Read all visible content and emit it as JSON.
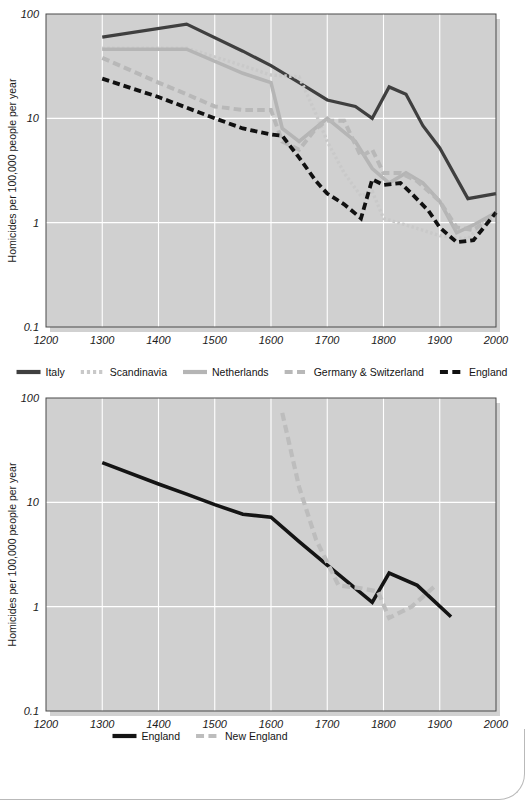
{
  "chart_data": [
    {
      "id": "chart-top",
      "type": "line",
      "title": "",
      "xlabel": "",
      "ylabel": "Homicides per 100,000 people per year",
      "xlim": [
        1200,
        2000
      ],
      "ylim": [
        0.1,
        100
      ],
      "yscale": "log",
      "xticks": [
        1200,
        1300,
        1400,
        1500,
        1600,
        1700,
        1800,
        1900,
        2000
      ],
      "yticks": [
        0.1,
        1,
        10,
        100
      ],
      "ytick_labels": [
        "0.1",
        "1",
        "10",
        "100"
      ],
      "grid": true,
      "legend_position": "below",
      "series": [
        {
          "name": "Italy",
          "color": "#3f3f3f",
          "style": "solid",
          "width": 3.2,
          "points": [
            [
              1300,
              60
            ],
            [
              1450,
              80
            ],
            [
              1550,
              44
            ],
            [
              1600,
              32
            ],
            [
              1650,
              22
            ],
            [
              1700,
              15
            ],
            [
              1750,
              13
            ],
            [
              1780,
              10
            ],
            [
              1810,
              20
            ],
            [
              1840,
              17
            ],
            [
              1870,
              8.5
            ],
            [
              1900,
              5.2
            ],
            [
              1950,
              1.7
            ],
            [
              2000,
              1.9
            ]
          ]
        },
        {
          "name": "Scandinavia",
          "color": "#c9c9c9",
          "style": "dotted",
          "width": 3.4,
          "points": [
            [
              1300,
              47
            ],
            [
              1450,
              47
            ],
            [
              1550,
              32
            ],
            [
              1600,
              26
            ],
            [
              1650,
              25
            ],
            [
              1680,
              11
            ],
            [
              1700,
              6.0
            ],
            [
              1730,
              3.0
            ],
            [
              1760,
              1.8
            ],
            [
              1780,
              2.0
            ],
            [
              1800,
              1.1
            ],
            [
              1840,
              0.95
            ],
            [
              1900,
              0.75
            ],
            [
              1950,
              0.7
            ],
            [
              2000,
              1.3
            ]
          ]
        },
        {
          "name": "Netherlands",
          "color": "#b5b5b5",
          "style": "solid",
          "width": 3.6,
          "points": [
            [
              1300,
              46
            ],
            [
              1450,
              46
            ],
            [
              1550,
              27
            ],
            [
              1600,
              22
            ],
            [
              1620,
              8.0
            ],
            [
              1650,
              6.0
            ],
            [
              1700,
              10
            ],
            [
              1750,
              6.0
            ],
            [
              1780,
              3.3
            ],
            [
              1810,
              2.4
            ],
            [
              1840,
              3.0
            ],
            [
              1870,
              2.4
            ],
            [
              1900,
              1.6
            ],
            [
              1930,
              0.8
            ],
            [
              1960,
              0.95
            ],
            [
              2000,
              1.25
            ]
          ]
        },
        {
          "name": "Germany & Switzerland",
          "color": "#b8b8b8",
          "style": "dashed",
          "width": 4.0,
          "points": [
            [
              1300,
              38
            ],
            [
              1400,
              22
            ],
            [
              1450,
              17
            ],
            [
              1500,
              13
            ],
            [
              1550,
              12
            ],
            [
              1600,
              12
            ],
            [
              1620,
              6.0
            ],
            [
              1650,
              5.0
            ],
            [
              1680,
              8.0
            ],
            [
              1700,
              9.5
            ],
            [
              1730,
              9.5
            ],
            [
              1760,
              4.3
            ],
            [
              1780,
              5.0
            ],
            [
              1800,
              3.0
            ],
            [
              1830,
              3.0
            ],
            [
              1860,
              2.5
            ],
            [
              1900,
              1.6
            ],
            [
              1930,
              0.9
            ],
            [
              1960,
              0.85
            ],
            [
              2000,
              1.2
            ]
          ]
        },
        {
          "name": "England",
          "color": "#111111",
          "style": "dashed",
          "width": 3.8,
          "points": [
            [
              1300,
              24
            ],
            [
              1400,
              16
            ],
            [
              1500,
              10
            ],
            [
              1550,
              8.0
            ],
            [
              1600,
              7.0
            ],
            [
              1620,
              6.8
            ],
            [
              1650,
              4.2
            ],
            [
              1680,
              2.5
            ],
            [
              1700,
              1.9
            ],
            [
              1730,
              1.5
            ],
            [
              1760,
              1.1
            ],
            [
              1780,
              2.6
            ],
            [
              1800,
              2.3
            ],
            [
              1830,
              2.4
            ],
            [
              1850,
              1.9
            ],
            [
              1880,
              1.3
            ],
            [
              1900,
              0.9
            ],
            [
              1930,
              0.65
            ],
            [
              1960,
              0.68
            ],
            [
              2000,
              1.25
            ]
          ]
        }
      ]
    },
    {
      "id": "chart-bottom",
      "type": "line",
      "title": "",
      "xlabel": "",
      "ylabel": "Homicides per 100,000 people per year",
      "xlim": [
        1200,
        2000
      ],
      "ylim": [
        0.1,
        100
      ],
      "yscale": "log",
      "xticks": [
        1200,
        1300,
        1400,
        1500,
        1600,
        1700,
        1800,
        1900,
        2000
      ],
      "yticks": [
        0.1,
        1,
        10,
        100
      ],
      "ytick_labels": [
        "0.1",
        "1",
        "10",
        "100"
      ],
      "grid": true,
      "legend_position": "below",
      "series": [
        {
          "name": "England",
          "color": "#141414",
          "style": "solid",
          "width": 3.6,
          "points": [
            [
              1300,
              24
            ],
            [
              1400,
              15
            ],
            [
              1450,
              12
            ],
            [
              1500,
              9.5
            ],
            [
              1550,
              7.7
            ],
            [
              1600,
              7.2
            ],
            [
              1650,
              4.2
            ],
            [
              1700,
              2.5
            ],
            [
              1750,
              1.5
            ],
            [
              1780,
              1.1
            ],
            [
              1810,
              2.1
            ],
            [
              1860,
              1.6
            ],
            [
              1920,
              0.8
            ]
          ]
        },
        {
          "name": "New England",
          "color": "#bdbdbd",
          "style": "dashed",
          "width": 4.2,
          "points": [
            [
              1620,
              72
            ],
            [
              1650,
              14
            ],
            [
              1680,
              4.4
            ],
            [
              1720,
              1.6
            ],
            [
              1760,
              1.5
            ],
            [
              1790,
              1.4
            ],
            [
              1810,
              0.78
            ],
            [
              1850,
              1.0
            ],
            [
              1890,
              1.55
            ]
          ]
        }
      ]
    }
  ],
  "chart1": {
    "y_axis_label": "Homicides per 100,000 people per year",
    "y_tick_labels": [
      "100",
      "10",
      "1",
      "0.1"
    ],
    "x_tick_labels": [
      "1200",
      "1300",
      "1400",
      "1500",
      "1600",
      "1700",
      "1800",
      "1900",
      "2000"
    ],
    "legend": [
      {
        "label": "Italy",
        "color": "#3f3f3f",
        "style": "solid"
      },
      {
        "label": "Scandinavia",
        "color": "#c9c9c9",
        "style": "dotted"
      },
      {
        "label": "Netherlands",
        "color": "#b5b5b5",
        "style": "solid"
      },
      {
        "label": "Germany & Switzerland",
        "color": "#b8b8b8",
        "style": "dashed"
      },
      {
        "label": "England",
        "color": "#111111",
        "style": "dashed"
      }
    ]
  },
  "chart2": {
    "y_axis_label": "Homicides per 100,000 people per year",
    "y_tick_labels": [
      "100",
      "10",
      "1",
      "0.1"
    ],
    "x_tick_labels": [
      "1200",
      "1300",
      "1400",
      "1500",
      "1600",
      "1700",
      "1800",
      "1900",
      "2000"
    ],
    "legend": [
      {
        "label": "England",
        "color": "#141414",
        "style": "solid"
      },
      {
        "label": "New England",
        "color": "#bdbdbd",
        "style": "dashed"
      }
    ]
  },
  "colors": {
    "plot_background": "#d0d0d0",
    "grid": "#ffffff",
    "frame": "#4a4a4a",
    "page_background": "#ffffff",
    "text": "#1a1a1a"
  }
}
